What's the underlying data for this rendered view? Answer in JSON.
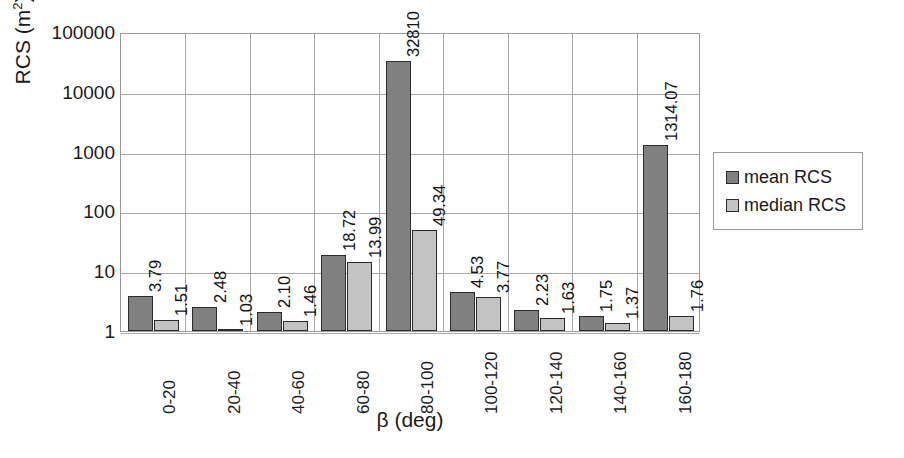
{
  "chart_data": {
    "type": "bar",
    "title": "",
    "xlabel": "β (deg)",
    "ylabel": "RCS (m²)",
    "ylabel_base": "RCS (m",
    "ylabel_sup": "2",
    "ylabel_close": ")",
    "yscale": "log",
    "ylim": [
      1,
      100000
    ],
    "ytick_labels": [
      "100000",
      "10000",
      "1000",
      "100",
      "10",
      "1"
    ],
    "ytick_values": [
      100000,
      10000,
      1000,
      100,
      10,
      1
    ],
    "grid": true,
    "legend_position": "right",
    "categories": [
      "0-20",
      "20-40",
      "40-60",
      "60-80",
      "80-100",
      "100-120",
      "120-140",
      "140-160",
      "160-180"
    ],
    "series": [
      {
        "name": "mean RCS",
        "color": "#808080",
        "values": [
          3.79,
          2.48,
          2.1,
          18.72,
          32810,
          4.53,
          2.23,
          1.75,
          1314.07
        ],
        "labels": [
          "3.79",
          "2.48",
          "2.10",
          "18.72",
          "32810",
          "4.53",
          "2.23",
          "1.75",
          "1314.07"
        ]
      },
      {
        "name": "median RCS",
        "color": "#c3c3c3",
        "values": [
          1.51,
          1.03,
          1.46,
          13.99,
          49.34,
          3.77,
          1.63,
          1.37,
          1.76
        ],
        "labels": [
          "1.51",
          "1.03",
          "1.46",
          "13.99",
          "49.34",
          "3.77",
          "1.63",
          "1.37",
          "1.76"
        ]
      }
    ]
  },
  "legend": {
    "items": [
      {
        "label": "mean RCS",
        "color": "#808080"
      },
      {
        "label": "median RCS",
        "color": "#c3c3c3"
      }
    ]
  },
  "colors": {
    "mean": "#808080",
    "median": "#c3c3c3",
    "grid": "#a8a8a8",
    "axis": "#9a9a9a",
    "bar_outline": "#2b2b2b",
    "text": "#1a1a1a",
    "background": "#ffffff"
  }
}
